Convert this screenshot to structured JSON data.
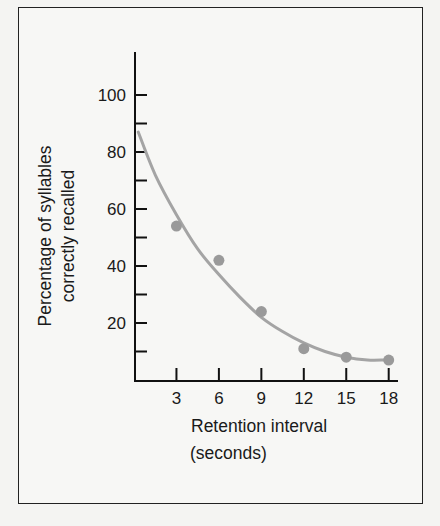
{
  "chart_data": {
    "type": "scatter",
    "title": "",
    "xlabel": "Retention interval (seconds)",
    "xlabel_lines": [
      "Retention interval",
      "(seconds)"
    ],
    "ylabel": "Percentage of syllables correctly recalled",
    "ylabel_lines": [
      "Percentage of syllables",
      "correctly recalled"
    ],
    "xlim": [
      0,
      19
    ],
    "ylim": [
      0,
      115
    ],
    "x_ticks": [
      3,
      6,
      9,
      12,
      15,
      18
    ],
    "y_ticks": [
      20,
      40,
      60,
      80,
      100
    ],
    "y_minor_ticks": [
      10,
      30,
      50,
      70,
      90
    ],
    "grid": false,
    "legend": null,
    "series": [
      {
        "name": "Observed recall",
        "kind": "points",
        "x": [
          3,
          6,
          9,
          12,
          15,
          18
        ],
        "y": [
          54,
          42,
          24,
          11,
          8,
          7
        ],
        "color": "#9a9a9a"
      },
      {
        "name": "Fitted curve",
        "kind": "line",
        "x": [
          0.3,
          1.5,
          3,
          4.5,
          6,
          7.5,
          9,
          10.5,
          12,
          13.5,
          15,
          16.5,
          17.7
        ],
        "y": [
          87,
          72,
          58,
          46,
          37,
          29,
          22,
          17,
          13,
          10,
          8,
          7,
          7
        ],
        "color": "#a4a4a4"
      }
    ]
  }
}
